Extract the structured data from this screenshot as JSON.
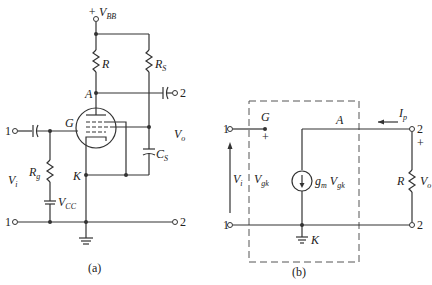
{
  "figure_a": {
    "caption": "(a)",
    "supply": "+ V",
    "supply_sub": "BB",
    "labels": {
      "R": "R",
      "Rs": "R",
      "Rs_sub": "S",
      "A": "A",
      "G": "G",
      "K": "K",
      "Vo": "V",
      "Vo_sub": "o",
      "Cs": "C",
      "Cs_sub": "S",
      "Rg": "R",
      "Rg_sub": "g",
      "Vcc": "V",
      "Vcc_sub": "CC",
      "Vi": "V",
      "Vi_sub": "i"
    },
    "terminals": [
      "1",
      "2",
      "1",
      "2"
    ]
  },
  "figure_b": {
    "caption": "(b)",
    "labels": {
      "G": "G",
      "plus_g": "+",
      "A": "A",
      "Ip": "I",
      "Ip_sub": "p",
      "plus_2": "+",
      "Vi": "V",
      "Vi_sub": "i",
      "Vgk": "V",
      "Vgk_sub": "gk",
      "gm": "g",
      "gm_sub": "m",
      "gmV": "V",
      "gmV_sub": "gk",
      "R": "R",
      "Vo": "V",
      "Vo_sub": "o",
      "K": "K"
    },
    "terminals": [
      "1",
      "2",
      "1",
      "2"
    ]
  }
}
